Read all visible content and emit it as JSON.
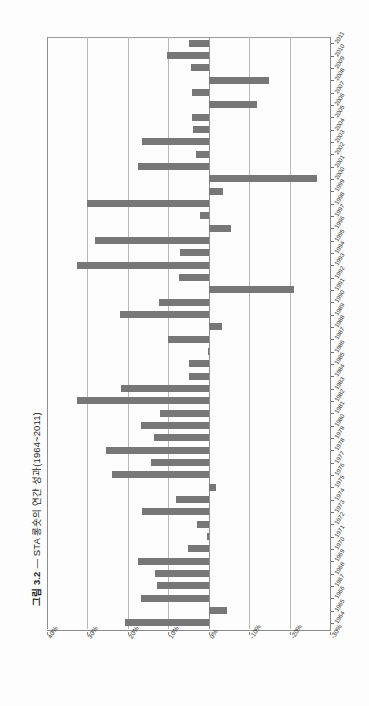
{
  "figure": {
    "label": "그림 3.2",
    "dash": "—",
    "caption": "STA 롱숏의 연간 성과(1964~2011)",
    "full_title": "그림 3.2 — STA 롱숏의 연간 성과(1964~2011)"
  },
  "colors": {
    "bar": "#777777",
    "gridline": "#b9b9b9",
    "axis": "#8a8a8a",
    "text": "#2a2a2a",
    "background": "#fdfdfd"
  },
  "chart_data": {
    "type": "bar",
    "orientation": "horizontal",
    "title": "그림 3.2 — STA 롱숏의 연간 성과(1964~2011)",
    "xlabel": "",
    "ylabel": "",
    "grid": true,
    "legend": null,
    "value_axis": {
      "ticks": [
        40,
        30,
        20,
        10,
        0,
        -10,
        -20,
        -30
      ],
      "tick_labels": [
        "40%",
        "30%",
        "20%",
        "10%",
        "0%",
        "-10%",
        "-20%",
        "-30%"
      ],
      "range": [
        40,
        -30
      ],
      "unit": "%"
    },
    "categories": [
      "1964",
      "1965",
      "1966",
      "1967",
      "1968",
      "1969",
      "1970",
      "1971",
      "1972",
      "1973",
      "1974",
      "1975",
      "1976",
      "1977",
      "1978",
      "1979",
      "1980",
      "1981",
      "1982",
      "1983",
      "1984",
      "1985",
      "1986",
      "1987",
      "1988",
      "1989",
      "1990",
      "1991",
      "1992",
      "1993",
      "1994",
      "1995",
      "1996",
      "1997",
      "1998",
      "1999",
      "2000",
      "2001",
      "2002",
      "2003",
      "2004",
      "2005",
      "2006",
      "2007",
      "2008",
      "2009",
      "2010",
      "2011"
    ],
    "values": [
      20.6,
      -4.5,
      16.8,
      12.7,
      13.2,
      17.5,
      5.2,
      0.4,
      3.0,
      16.5,
      8.0,
      -1.9,
      24.0,
      14.3,
      25.5,
      13.5,
      16.8,
      12.0,
      32.5,
      21.8,
      4.8,
      5.0,
      0.3,
      10.0,
      -3.2,
      22.0,
      12.2,
      -21.2,
      7.4,
      32.6,
      7.0,
      28.2,
      -5.5,
      2.2,
      30.0,
      -3.5,
      -26.8,
      17.6,
      3.2,
      16.6,
      4.0,
      4.1,
      -12.0,
      4.2,
      -14.9,
      4.5,
      10.2,
      4.8
    ]
  }
}
